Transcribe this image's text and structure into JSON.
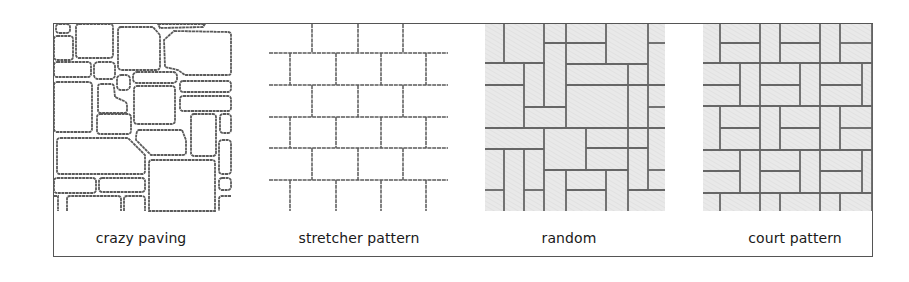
{
  "figure": {
    "panels": [
      {
        "id": "crazy-paving",
        "label": "crazy paving",
        "fill": "#ffffff"
      },
      {
        "id": "stretcher-pattern",
        "label": "stretcher pattern",
        "fill": "#ffffff"
      },
      {
        "id": "random",
        "label": "random",
        "fill": "#e6e6e6"
      },
      {
        "id": "court-pattern",
        "label": "court pattern",
        "fill": "#e6e6e6"
      }
    ],
    "colors": {
      "line": "#5a5a5a",
      "frame": "#555555",
      "shaded_fill": "#e6e6e6"
    }
  }
}
